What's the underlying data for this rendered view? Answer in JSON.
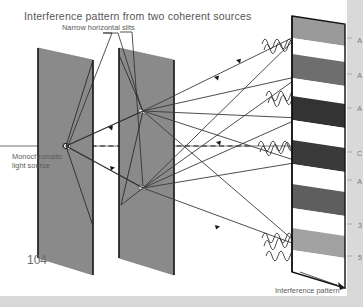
{
  "page": {
    "number": "104",
    "background": "#d9d9d9",
    "canvas": "#ffffff"
  },
  "title": "Interference pattern from two coherent sources",
  "labels": {
    "slits": "Narrow horizontal slits",
    "source_line1": "Monochromatic",
    "source_line2": "light source",
    "caption": "Interference pattern"
  },
  "edge_labels": [
    {
      "text": "A",
      "top": 37
    },
    {
      "text": "A",
      "top": 72
    },
    {
      "text": "A",
      "top": 105
    },
    {
      "text": "C",
      "top": 150
    },
    {
      "text": "A",
      "top": 178
    },
    {
      "text": "3",
      "top": 222
    },
    {
      "text": "5",
      "top": 254
    }
  ],
  "colors": {
    "barrier_face": "#8a8a8a",
    "barrier_edge": "#1a1a1a",
    "ray": "#3a3a3a",
    "axis": "#707070",
    "wave": "#2b2b2b",
    "fringe_dark": "#3a3a3a",
    "fringe_mid": "#6e6e6e",
    "fringe_light": "#a8a8a8",
    "fringe_bright": "#ffffff",
    "screen_edge": "#111111"
  },
  "optics": {
    "source_point": {
      "x": 66,
      "y": 146
    },
    "barrier1": {
      "name": "single-slit-barrier",
      "slit_count": 1
    },
    "barrier2": {
      "name": "double-slit-barrier",
      "slit_count": 2
    },
    "screen": {
      "name": "observation-screen",
      "fringe_count": 11
    }
  },
  "chart_data": {
    "type": "diagram",
    "title": "Interference pattern from two coherent sources",
    "fringes": [
      {
        "index": 0,
        "kind": "dark",
        "shade": "#3a3a3a"
      },
      {
        "index": 1,
        "kind": "bright",
        "shade": "#ffffff"
      },
      {
        "index": 2,
        "kind": "dark",
        "shade": "#4a4a4a"
      },
      {
        "index": 3,
        "kind": "bright",
        "shade": "#ffffff"
      },
      {
        "index": 4,
        "kind": "dark",
        "shade": "#2f2f2f"
      },
      {
        "index": 5,
        "kind": "bright",
        "shade": "#ffffff"
      },
      {
        "index": 6,
        "kind": "dark",
        "shade": "#3a3a3a"
      },
      {
        "index": 7,
        "kind": "bright",
        "shade": "#ffffff"
      },
      {
        "index": 8,
        "kind": "dark",
        "shade": "#5a5a5a"
      },
      {
        "index": 9,
        "kind": "bright",
        "shade": "#ffffff"
      },
      {
        "index": 10,
        "kind": "dark",
        "shade": "#9a9a9a"
      }
    ]
  }
}
